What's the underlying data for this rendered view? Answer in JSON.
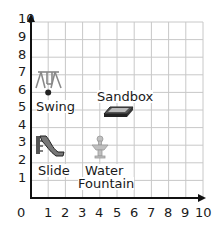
{
  "grid": {
    "x_min": 0,
    "x_max": 10,
    "y_min": 0,
    "y_max": 10,
    "x_ticks": [
      "0",
      "1",
      "2",
      "3",
      "4",
      "5",
      "6",
      "7",
      "8",
      "9",
      "10"
    ],
    "y_ticks": [
      "1",
      "2",
      "3",
      "4",
      "5",
      "6",
      "7",
      "8",
      "9",
      "10"
    ],
    "grid_color": "#c8c8c8",
    "axis_color": "#111111"
  },
  "items": [
    {
      "id": "swing",
      "label": "Swing",
      "x": 1,
      "y": 6,
      "icon": "swing-icon"
    },
    {
      "id": "sandbox",
      "label": "Sandbox",
      "x": 5,
      "y": 5,
      "icon": "sandbox-icon"
    },
    {
      "id": "slide",
      "label": "Slide",
      "x": 1,
      "y": 3,
      "icon": "slide-icon"
    },
    {
      "id": "fountain",
      "label_line1": "Water",
      "label_line2": "Fountain",
      "x": 4,
      "y": 3,
      "icon": "water-fountain-icon"
    }
  ],
  "labels": {
    "swing": "Swing",
    "sandbox": "Sandbox",
    "slide": "Slide",
    "fountain_1": "Water",
    "fountain_2": "Fountain"
  }
}
